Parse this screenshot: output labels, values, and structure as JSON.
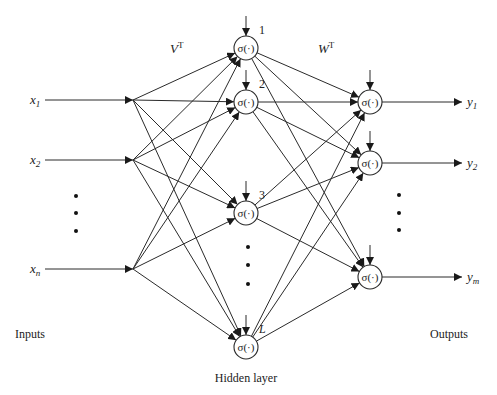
{
  "diagram": {
    "type": "feedforward-neural-network",
    "labels": {
      "inputs": "Inputs",
      "outputs": "Outputs",
      "hidden_layer": "Hidden layer",
      "input_weights": "V",
      "input_weights_sup": "T",
      "output_weights": "W",
      "output_weights_sup": "T",
      "activation": "σ(·)"
    },
    "inputs": [
      {
        "id": "x1",
        "label": "x",
        "sub": "1",
        "y": 100
      },
      {
        "id": "x2",
        "label": "x",
        "sub": "2",
        "y": 160
      },
      {
        "id": "xn",
        "label": "x",
        "sub": "n",
        "y": 269
      }
    ],
    "hidden": [
      {
        "id": "h1",
        "index_label": "1",
        "y": 48
      },
      {
        "id": "h2",
        "index_label": "2",
        "y": 102
      },
      {
        "id": "h3",
        "index_label": "3",
        "y": 213
      },
      {
        "id": "hL",
        "index_label": "L",
        "y": 347
      }
    ],
    "outputs": [
      {
        "id": "y1",
        "label": "y",
        "sub": "1",
        "y": 102
      },
      {
        "id": "y2",
        "label": "y",
        "sub": "2",
        "y": 163
      },
      {
        "id": "ym",
        "label": "y",
        "sub": "m",
        "y": 277
      }
    ],
    "ellipsis": {
      "inputs": [
        196,
        213,
        231
      ],
      "hidden": [
        247,
        265,
        284
      ],
      "outputs": [
        195,
        213,
        230
      ]
    }
  }
}
